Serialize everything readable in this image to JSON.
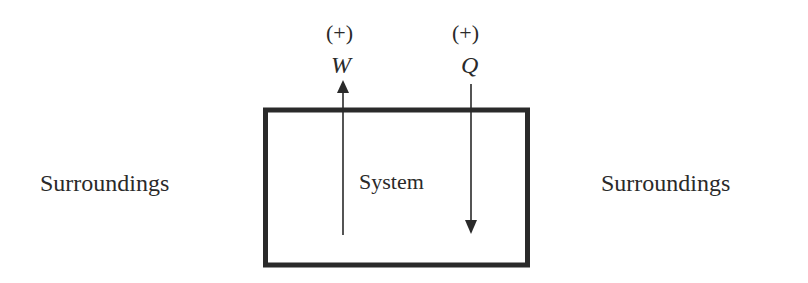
{
  "diagram": {
    "left_label": "Surroundings",
    "right_label": "Surroundings",
    "system_label": "System",
    "work": {
      "sign": "(+)",
      "symbol": "W",
      "direction": "up (out of system)"
    },
    "heat": {
      "sign": "(+)",
      "symbol": "Q",
      "direction": "down (into system)"
    }
  },
  "colors": {
    "stroke": "#2a2a2a",
    "background": "#ffffff"
  }
}
